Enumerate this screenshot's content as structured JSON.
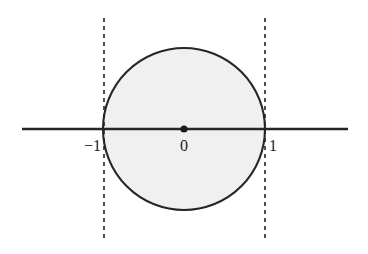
{
  "figure": {
    "title": "",
    "background_color": "#ffffff",
    "width": 368,
    "height": 254
  },
  "chart_data": {
    "type": "scatter",
    "title": "",
    "xlabel": "",
    "ylabel": "",
    "xlim": [
      -2.0,
      2.02
    ],
    "ylim": [
      -1.37,
      1.37
    ],
    "grid": false,
    "legend": null,
    "axes": [
      {
        "name": "real-axis",
        "orientation": "horizontal",
        "y_value": 0,
        "x_start": -2.0,
        "x_end": 2.02,
        "color": "#262626",
        "width_px": 2.4,
        "style": "solid",
        "arrowheads": false
      }
    ],
    "shapes": [
      {
        "name": "unit-circle",
        "type": "circle",
        "center": [
          0,
          0
        ],
        "radius": 1,
        "fill": "#f0f0f0",
        "stroke": "#262626",
        "stroke_width_px": 2.1,
        "stroke_style": "solid"
      },
      {
        "name": "left-boundary-line",
        "type": "vline",
        "x": -1,
        "y_start": -1.37,
        "y_end": 1.37,
        "stroke": "#222222",
        "stroke_width_px": 1.6,
        "stroke_style": "dashed",
        "dash_pattern": "4,4"
      },
      {
        "name": "right-boundary-line",
        "type": "vline",
        "x": 1,
        "y_start": -1.37,
        "y_end": 1.37,
        "stroke": "#222222",
        "stroke_width_px": 1.6,
        "stroke_style": "dashed",
        "dash_pattern": "4,4"
      }
    ],
    "points": [
      {
        "name": "origin-point",
        "x": 0,
        "y": 0,
        "radius_px": 3.6,
        "color": "#1c1c1c",
        "label": "0"
      }
    ],
    "tick_labels": [
      {
        "name": "tick-minus-one",
        "text": "−1",
        "x": -1,
        "y": 0,
        "align": "right",
        "position": "below-left"
      },
      {
        "name": "tick-zero",
        "text": "0",
        "x": 0,
        "y": 0,
        "align": "center",
        "position": "below"
      },
      {
        "name": "tick-one",
        "text": "1",
        "x": 1,
        "y": 0,
        "align": "left",
        "position": "below-right"
      }
    ],
    "colors": {
      "stroke": "#262626",
      "fill": "#f0f0f0",
      "dash": "#222222",
      "text": "#1c1c1c",
      "background": "#ffffff"
    }
  }
}
